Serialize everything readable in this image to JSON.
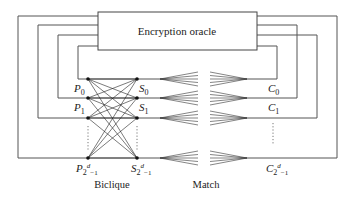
{
  "diagram": {
    "oracle_label": "Encryption oracle",
    "biclique_label": "Biclique",
    "match_label": "Match",
    "plaintexts": {
      "p0": {
        "base": "P",
        "sub": "0"
      },
      "p1": {
        "base": "P",
        "sub": "1"
      },
      "plast": {
        "base": "P",
        "sub": "2",
        "sup": "d",
        "subtail": "−1"
      }
    },
    "states": {
      "s0": {
        "base": "S",
        "sub": "0"
      },
      "s1": {
        "base": "S",
        "sub": "1"
      },
      "slast": {
        "base": "S",
        "sub": "2",
        "sup": "d",
        "subtail": "−1"
      }
    },
    "ciphertexts": {
      "c0": {
        "base": "C",
        "sub": "0"
      },
      "c1": {
        "base": "C",
        "sub": "1"
      },
      "clast": {
        "base": "C",
        "sub": "2",
        "sup": "d",
        "subtail": "−1"
      }
    }
  }
}
